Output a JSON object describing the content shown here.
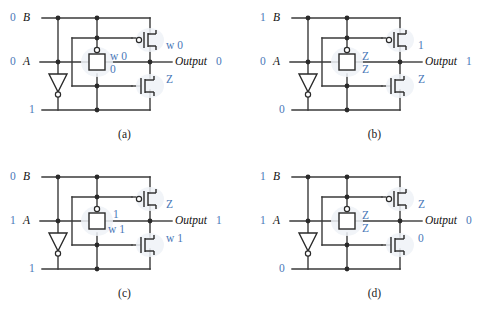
{
  "figure": {
    "type": "circuit-diagram",
    "panel_count": 4
  },
  "common": {
    "input_b_name": "B",
    "input_a_name": "A",
    "output_name": "Output",
    "components": {
      "pmos": "pmos-transistor",
      "nmos": "nmos-transistor",
      "pass_gate": "transmission-gate",
      "inverter": "inverter-triangle"
    },
    "colors": {
      "signal": "#4a78b8",
      "wire": "#3a3a3a",
      "text": "#111111"
    }
  },
  "panels": [
    {
      "id": "a",
      "caption": "(a)",
      "b_value": "0",
      "a_value": "0",
      "inv_out_value": "1",
      "output_value": "0",
      "label_pmos_right": "w 0",
      "label_gate_top": "w 0",
      "label_gate_bottom": "0",
      "label_nmos_right": "Z"
    },
    {
      "id": "b",
      "caption": "(b)",
      "b_value": "1",
      "a_value": "0",
      "inv_out_value": "0",
      "output_value": "1",
      "label_pmos_right": "1",
      "label_gate_top": "Z",
      "label_gate_bottom": "Z",
      "label_nmos_right": "Z"
    },
    {
      "id": "c",
      "caption": "(c)",
      "b_value": "0",
      "a_value": "1",
      "inv_out_value": "1",
      "output_value": "1",
      "label_pmos_right": "Z",
      "label_gate_top": "1",
      "label_gate_bottom": "w 1",
      "label_nmos_right": "w 1"
    },
    {
      "id": "d",
      "caption": "(d)",
      "b_value": "1",
      "a_value": "1",
      "inv_out_value": "0",
      "output_value": "0",
      "label_pmos_right": "Z",
      "label_gate_top": "Z",
      "label_gate_bottom": "Z",
      "label_nmos_right": "0"
    }
  ]
}
